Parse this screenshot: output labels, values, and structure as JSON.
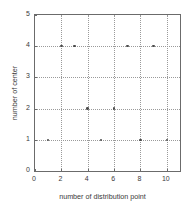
{
  "chart_data": {
    "type": "scatter",
    "title": "",
    "xlabel": "number of distribution point",
    "ylabel": "number of center",
    "xlim": [
      0,
      11
    ],
    "ylim": [
      0,
      5
    ],
    "xticks": [
      0,
      2,
      4,
      6,
      8,
      10
    ],
    "yticks": [
      0,
      1,
      2,
      3,
      4,
      5
    ],
    "xtick_labels": [
      "0",
      "2",
      "4",
      "6",
      "8",
      "10"
    ],
    "ytick_labels": [
      "0",
      "1",
      "2",
      "3",
      "4",
      "5"
    ],
    "grid": true,
    "grid_style": "dotted",
    "legend": null,
    "marker": "dot",
    "marker_color": "#4a4a4a",
    "axis_color": "#6b6b6b",
    "grid_color": "#9a9a9a",
    "x": [
      1,
      2,
      3,
      4,
      5,
      6,
      7,
      8,
      9,
      10
    ],
    "y": [
      1,
      4,
      4,
      2,
      1,
      2,
      4,
      1,
      4,
      1
    ],
    "points": [
      {
        "x": 1,
        "y": 1
      },
      {
        "x": 2,
        "y": 4
      },
      {
        "x": 3,
        "y": 4
      },
      {
        "x": 4,
        "y": 2
      },
      {
        "x": 5,
        "y": 1
      },
      {
        "x": 6,
        "y": 2
      },
      {
        "x": 7,
        "y": 4
      },
      {
        "x": 8,
        "y": 1
      },
      {
        "x": 9,
        "y": 4
      },
      {
        "x": 10,
        "y": 1
      }
    ]
  }
}
